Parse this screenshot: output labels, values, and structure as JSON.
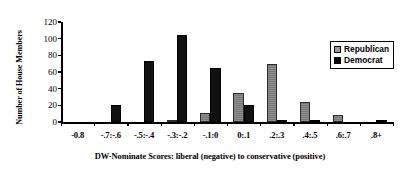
{
  "chart_data": {
    "type": "bar",
    "title": "",
    "xlabel": "DW-Nominate Scores: liberal (negative) to conservative (positive)",
    "ylabel": "Number of House Members",
    "categories": [
      "-0.8",
      "-.7:-.6",
      "-.5:-.4",
      "-.3:-.2",
      "-.1:0",
      "0:.1",
      ".2:.3",
      ".4:.5",
      ".6:.7",
      ".8+"
    ],
    "series": [
      {
        "name": "Republican",
        "color": "#808080",
        "values": [
          0,
          0,
          0,
          1,
          11,
          35,
          70,
          24,
          9,
          0
        ]
      },
      {
        "name": "Democrat",
        "color": "#111111",
        "values": [
          0,
          20,
          73,
          104,
          65,
          21,
          3,
          2,
          0,
          1
        ]
      }
    ],
    "ylim": [
      0,
      120
    ],
    "yticks": [
      0,
      20,
      40,
      60,
      80,
      100,
      120
    ],
    "ytick_labels": [
      "0",
      "20",
      "40",
      "60",
      "80",
      "100",
      "120"
    ],
    "grid": false,
    "legend_position": "upper-right",
    "legend_entries": [
      "Republican",
      "Democrat"
    ]
  }
}
